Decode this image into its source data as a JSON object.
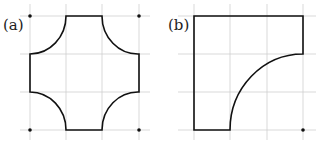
{
  "panels": [
    {
      "id": "a",
      "label": "(a)",
      "description": "Square with four quarter-circle notches cut from each corner"
    },
    {
      "id": "b",
      "label": "(b)",
      "description": "Square with one quarter-circle region removed from the lower-right"
    }
  ],
  "colors": {
    "grid": "#cfcfcf",
    "stroke": "#111111",
    "background": "#ffffff"
  }
}
